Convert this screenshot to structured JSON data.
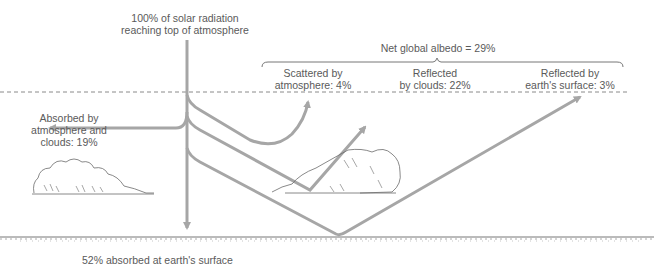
{
  "labels": {
    "incoming_line1": "100% of solar radiation",
    "incoming_line2": "reaching top of atmosphere",
    "albedo": "Net global albedo = 29%",
    "scattered_line1": "Scattered by",
    "scattered_line2": "atmosphere: 4%",
    "clouds_line1": "Reflected",
    "clouds_line2": "by clouds: 22%",
    "surface_refl_line1": "Reflected by",
    "surface_refl_line2": "earth's surface: 3%",
    "absorbed_atm_line1": "Absorbed by",
    "absorbed_atm_line2": "atmosphere and",
    "absorbed_atm_line3": "clouds: 19%",
    "absorbed_surface": "52% absorbed at earth's surface"
  },
  "values": {
    "incoming_pct": 100,
    "net_albedo_pct": 29,
    "scattered_atmosphere_pct": 4,
    "reflected_clouds_pct": 22,
    "reflected_surface_pct": 3,
    "absorbed_atmosphere_clouds_pct": 19,
    "absorbed_surface_pct": 52
  },
  "colors": {
    "arrow": "#a6a6a6",
    "text": "#5a5a5a",
    "dashed_line": "#8a8a8a",
    "ground": "#777777",
    "cloud_outline": "#6b6b6b"
  }
}
